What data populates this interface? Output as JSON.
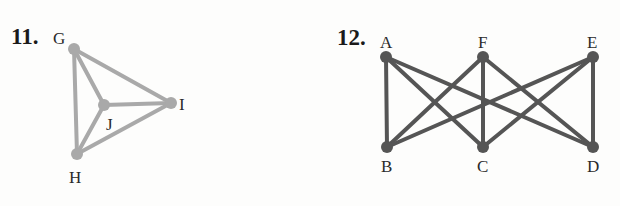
{
  "problems": [
    {
      "number": "11.",
      "color": "#a9a9a9",
      "nodes": [
        {
          "id": "G",
          "label": "G",
          "x": 74,
          "y": 49
        },
        {
          "id": "J",
          "label": "J",
          "x": 104,
          "y": 105
        },
        {
          "id": "I",
          "label": "I",
          "x": 171,
          "y": 103
        },
        {
          "id": "H",
          "label": "H",
          "x": 77,
          "y": 154
        }
      ],
      "edges": [
        [
          "G",
          "J"
        ],
        [
          "G",
          "I"
        ],
        [
          "G",
          "H"
        ],
        [
          "J",
          "I"
        ],
        [
          "J",
          "H"
        ],
        [
          "H",
          "I"
        ]
      ]
    },
    {
      "number": "12.",
      "color": "#555555",
      "nodes": [
        {
          "id": "A",
          "label": "A",
          "x": 386,
          "y": 57
        },
        {
          "id": "F",
          "label": "F",
          "x": 483,
          "y": 57
        },
        {
          "id": "E",
          "label": "E",
          "x": 593,
          "y": 57
        },
        {
          "id": "B",
          "label": "B",
          "x": 387,
          "y": 147
        },
        {
          "id": "C",
          "label": "C",
          "x": 483,
          "y": 147
        },
        {
          "id": "D",
          "label": "D",
          "x": 593,
          "y": 147
        }
      ],
      "edges": [
        [
          "A",
          "B"
        ],
        [
          "A",
          "C"
        ],
        [
          "A",
          "D"
        ],
        [
          "F",
          "B"
        ],
        [
          "F",
          "C"
        ],
        [
          "F",
          "D"
        ],
        [
          "E",
          "B"
        ],
        [
          "E",
          "C"
        ],
        [
          "E",
          "D"
        ]
      ]
    }
  ]
}
